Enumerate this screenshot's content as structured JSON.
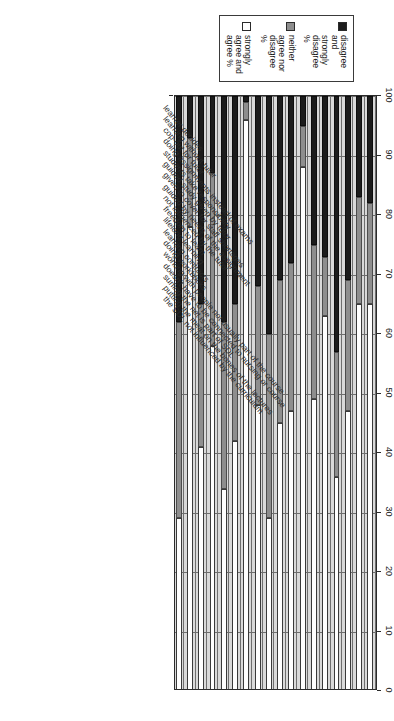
{
  "chart_data": {
    "type": "bar",
    "orientation": "stacked-bar",
    "title": "",
    "subtitle": "",
    "xlabel": "",
    "ylabel": "",
    "ylim": [
      0,
      100
    ],
    "grid": true,
    "legend_position": "top-left",
    "axis_ticks": [
      "100",
      "90",
      "80",
      "70",
      "60",
      "50",
      "40",
      "30",
      "20",
      "10",
      "0"
    ],
    "axis_direction": "descending-left-to-right",
    "categories": [
      "learner decides",
      "learning without tutor",
      "cop-out for tutor",
      "doing assignments instead of exams",
      "students take responsibility",
      "guided study given by tutor",
      "given to cover for staff shortages",
      "guided by needs of the assignment",
      "not influenced by the tutor",
      "freedom to learn",
      "lifelong learning",
      "learning contracts",
      "doing workbooks",
      "working with people not usually part of the course",
      "doesn't have to be connected to nursing or course",
      "surfing the net is part of SDL",
      "putting the meat on the bones of the lectures",
      "the SDL not influenced by the curriculum"
    ],
    "series": [
      {
        "name": "disagree and strongly disagree %",
        "color": "#1c1c1c",
        "values": [
          18,
          17,
          31,
          43,
          27,
          25,
          5,
          28,
          31,
          40,
          32,
          1,
          35,
          38,
          13,
          35,
          7,
          38
        ]
      },
      {
        "name": "neither agree nor disagree %",
        "color": "#8e8e8e",
        "values": [
          17,
          18,
          22,
          21,
          10,
          26,
          7,
          25,
          24,
          31,
          20,
          3,
          23,
          28,
          29,
          24,
          15,
          33
        ]
      },
      {
        "name": "strongly agree and agree %",
        "color": "#ffffff",
        "values": [
          65,
          65,
          47,
          36,
          63,
          49,
          88,
          47,
          45,
          29,
          48,
          96,
          42,
          34,
          58,
          41,
          78,
          29
        ]
      }
    ]
  },
  "legend": {
    "items": [
      {
        "label": "disagree\nand\nstrongly\ndisagree\n%",
        "swatch": "#1c1c1c",
        "name": "legend-disagree"
      },
      {
        "label": "neither\nagree nor\ndisagree\n%",
        "swatch": "#8e8e8e",
        "name": "legend-neither"
      },
      {
        "label": "strongly\nagree and\nagree %",
        "swatch": "#ffffff",
        "name": "legend-agree"
      }
    ]
  }
}
